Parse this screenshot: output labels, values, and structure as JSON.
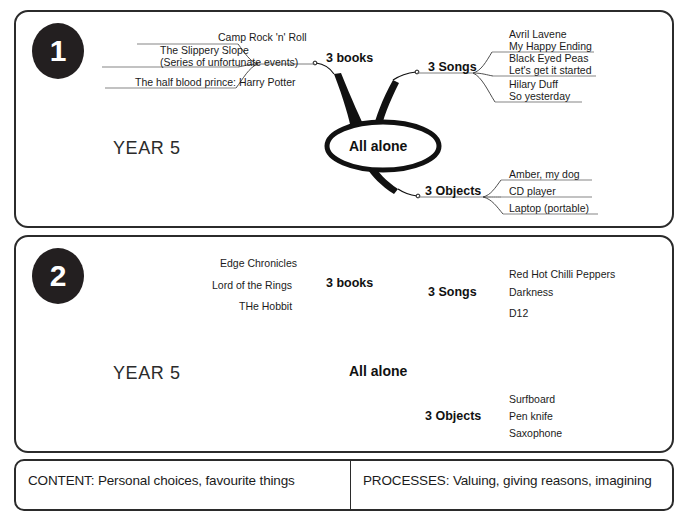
{
  "document": {
    "title": "All alone mind maps - Year 5"
  },
  "panels": [
    {
      "badge": "1",
      "year_label": "YEAR 5",
      "center_label": "All alone",
      "branches": [
        {
          "label": "3 books",
          "leaves": [
            {
              "lines": [
                "Camp Rock 'n' Roll"
              ]
            },
            {
              "lines": [
                "The Slippery Slope",
                "(Series of unfortunate events)"
              ]
            },
            {
              "lines": [
                "The half blood prince: Harry Potter"
              ]
            }
          ]
        },
        {
          "label": "3 Songs",
          "leaves": [
            {
              "lines": [
                "Avril Lavene",
                "My Happy Ending"
              ]
            },
            {
              "lines": [
                "Black Eyed Peas",
                "Let's get it started"
              ]
            },
            {
              "lines": [
                "Hilary Duff",
                "So yesterday"
              ]
            }
          ]
        },
        {
          "label": "3 Objects",
          "leaves": [
            {
              "lines": [
                "Amber, my dog"
              ]
            },
            {
              "lines": [
                "CD player"
              ]
            },
            {
              "lines": [
                "Laptop (portable)"
              ]
            }
          ]
        }
      ]
    },
    {
      "badge": "2",
      "year_label": "YEAR 5",
      "center_label": "All alone",
      "branches": [
        {
          "label": "3 books",
          "leaves": [
            {
              "lines": [
                "Edge Chronicles"
              ]
            },
            {
              "lines": [
                "Lord of the Rings"
              ]
            },
            {
              "lines": [
                "THe Hobbit"
              ]
            }
          ]
        },
        {
          "label": "3 Songs",
          "leaves": [
            {
              "lines": [
                "Red Hot Chilli Peppers"
              ]
            },
            {
              "lines": [
                "Darkness"
              ]
            },
            {
              "lines": [
                "D12"
              ]
            }
          ]
        },
        {
          "label": "3 Objects",
          "leaves": [
            {
              "lines": [
                "Surfboard"
              ]
            },
            {
              "lines": [
                "Pen knife"
              ]
            },
            {
              "lines": [
                "Saxophone"
              ]
            }
          ]
        }
      ]
    }
  ],
  "footer": {
    "left": "CONTENT: Personal choices, favourite things",
    "right": "PROCESSES: Valuing, giving reasons, imagining"
  },
  "colors": {
    "ink": "#1b1b1b",
    "frame": "#2b2b2b",
    "badge_fill": "#231f20",
    "badge_text": "#ffffff",
    "branch_stroke": "#111111",
    "leaf_rule": "#6f6f6f"
  }
}
